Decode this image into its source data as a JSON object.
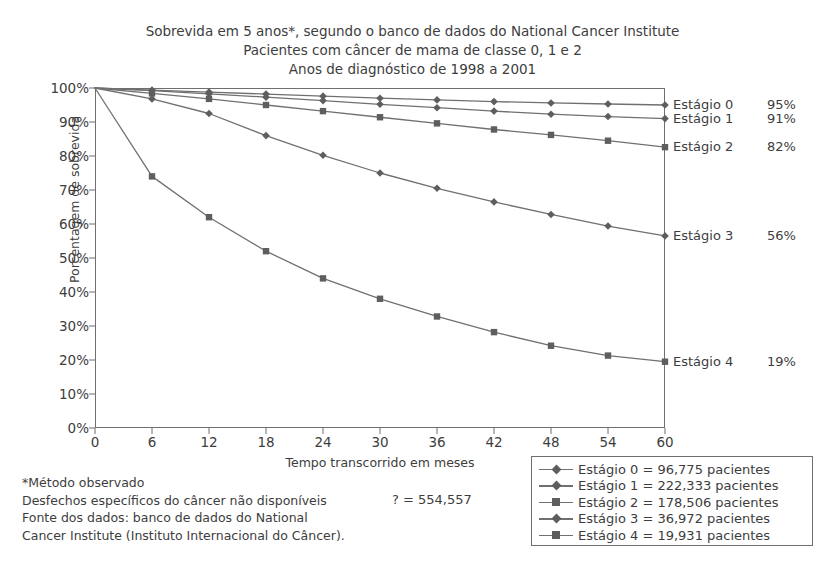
{
  "titles": [
    "Sobrevida em 5 anos*, segundo o banco de dados do National Cancer Institute",
    "Pacientes com câncer de mama de classe 0, 1 e 2",
    "Anos de diagnóstico de 1998 a 2001"
  ],
  "axes": {
    "ylabel": "Porcentagem de sobrevida",
    "xlabel": "Tempo transcorrido em meses",
    "yticks": [
      "100%",
      "90%",
      "80%",
      "70%",
      "60%",
      "50%",
      "40%",
      "30%",
      "20%",
      "10%",
      "0%"
    ],
    "xticks": [
      "0",
      "6",
      "12",
      "18",
      "24",
      "30",
      "36",
      "42",
      "48",
      "54",
      "60"
    ]
  },
  "end_labels": [
    {
      "name": "Estágio 0",
      "percent": "95%"
    },
    {
      "name": "Estágio 1",
      "percent": "91%"
    },
    {
      "name": "Estágio 2",
      "percent": "82%"
    },
    {
      "name": "Estágio 3",
      "percent": "56%"
    },
    {
      "name": "Estágio 4",
      "percent": "19%"
    }
  ],
  "legend": [
    {
      "label": "Estágio 0 = 96,775 pacientes",
      "marker": "diamond"
    },
    {
      "label": "Estágio 1 = 222,333 pacientes",
      "marker": "diamond"
    },
    {
      "label": "Estágio 2 = 178,506 pacientes",
      "marker": "square"
    },
    {
      "label": "Estágio 3 = 36,972 pacientes",
      "marker": "diamond"
    },
    {
      "label": "Estágio 4 = 19,931 pacientes",
      "marker": "square"
    }
  ],
  "footnotes": [
    "*Método observado",
    "Desfechos específicos do câncer não disponíveis",
    "Fonte dos dados: banco de dados do National",
    "Cancer Institute (Instituto Internacional do Câncer)."
  ],
  "total_note": "? = 554,557",
  "colors": {
    "line": "#707070",
    "marker": "#5e5e5e",
    "axis": "#6f6f6f",
    "text": "#3d3d3d"
  },
  "chart_data": {
    "type": "line",
    "title": "Sobrevida em 5 anos*, segundo o banco de dados do National Cancer Institute",
    "subtitle": "Pacientes com câncer de mama de classe 0, 1 e 2 — Anos de diagnóstico de 1998 a 2001",
    "xlabel": "Tempo transcorrido em meses",
    "ylabel": "Porcentagem de sobrevida",
    "xlim": [
      0,
      60
    ],
    "ylim": [
      0,
      100
    ],
    "grid": false,
    "legend_position": "bottom-right",
    "x": [
      0,
      6,
      12,
      18,
      24,
      30,
      36,
      42,
      48,
      54,
      60
    ],
    "series": [
      {
        "name": "Estágio 0",
        "marker": "diamond",
        "final": 95,
        "values": [
          100,
          99.4,
          98.8,
          98.2,
          97.6,
          97.0,
          96.5,
          96.0,
          95.6,
          95.3,
          95.0
        ]
      },
      {
        "name": "Estágio 1",
        "marker": "diamond",
        "final": 91,
        "values": [
          100,
          99.2,
          98.3,
          97.3,
          96.3,
          95.2,
          94.2,
          93.2,
          92.3,
          91.6,
          91.0
        ]
      },
      {
        "name": "Estágio 2",
        "marker": "square",
        "final": 82,
        "values": [
          100,
          98.4,
          96.8,
          95.0,
          93.2,
          91.4,
          89.6,
          87.8,
          86.2,
          84.5,
          82.6
        ]
      },
      {
        "name": "Estágio 3",
        "marker": "diamond",
        "final": 56,
        "values": [
          100,
          96.8,
          92.5,
          86.0,
          80.2,
          75.0,
          70.5,
          66.5,
          62.8,
          59.4,
          56.5
        ]
      },
      {
        "name": "Estágio 4",
        "marker": "square",
        "final": 19,
        "values": [
          100,
          74.0,
          62.0,
          52.0,
          44.0,
          38.0,
          32.8,
          28.2,
          24.2,
          21.3,
          19.5
        ]
      }
    ]
  }
}
